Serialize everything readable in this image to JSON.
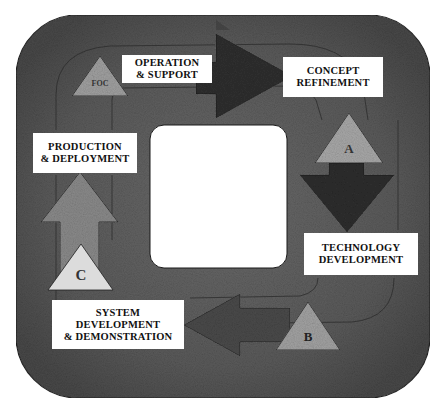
{
  "diagram": {
    "type": "acquisition-lifecycle-cycle",
    "colors": {
      "background": "#ffffff",
      "ring": "#5a5a5a",
      "ring_light": "#7a7a7a",
      "arrow_dark": "#2e2e2e",
      "triangle_fill": "#a8a8a8",
      "triangle_light": "#d8d8d8",
      "label_bg": "#ffffff",
      "center": "#ffffff"
    },
    "phases": [
      {
        "id": "concept-refinement",
        "lines": [
          "CONCEPT",
          "REFINEMENT"
        ]
      },
      {
        "id": "technology-development",
        "lines": [
          "TECHNOLOGY",
          "DEVELOPMENT"
        ]
      },
      {
        "id": "system-development-demonstration",
        "lines": [
          "SYSTEM",
          "DEVELOPMENT",
          "& DEMONSTRATION"
        ]
      },
      {
        "id": "production-deployment",
        "lines": [
          "PRODUCTION",
          "& DEPLOYMENT"
        ]
      },
      {
        "id": "operation-support",
        "lines": [
          "OPERATION",
          "& SUPPORT"
        ]
      }
    ],
    "milestones": [
      {
        "id": "A",
        "label": "A"
      },
      {
        "id": "B",
        "label": "B"
      },
      {
        "id": "C",
        "label": "C"
      },
      {
        "id": "FOC",
        "label": "FOC"
      }
    ]
  }
}
